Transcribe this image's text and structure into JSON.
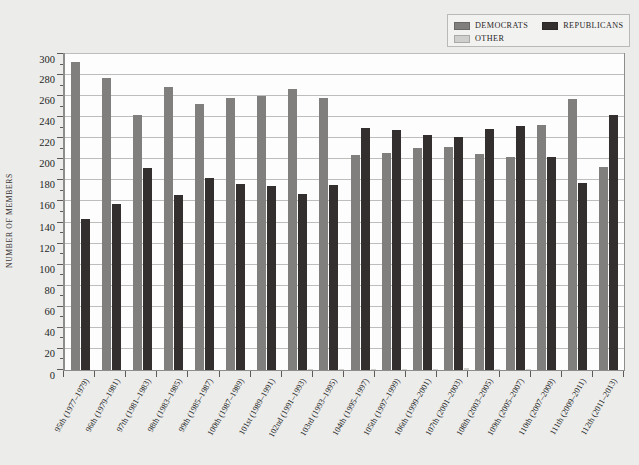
{
  "chart_data": {
    "type": "bar",
    "title": "",
    "subtitle": "",
    "xlabel": "",
    "ylabel": "NUMBER OF MEMBERS",
    "ylim": [
      0,
      300
    ],
    "ytick_step": 20,
    "yticks": [
      0,
      20,
      40,
      60,
      80,
      100,
      120,
      140,
      160,
      180,
      200,
      220,
      240,
      260,
      280,
      300
    ],
    "minor_tick_step": 10,
    "grid": true,
    "legend_position": "top-right",
    "categories": [
      "95th (1977–1979)",
      "96th (1979–1981)",
      "97th (1981–1983)",
      "98th (1983–1985)",
      "99th (1985–1987)",
      "100th (1987–1989)",
      "101st (1989–1991)",
      "102nd (1991–1993)",
      "103rd (1993–1995)",
      "104th (1995–1997)",
      "105th (1997–1999)",
      "106th (1999–2001)",
      "107th (2001–2003)",
      "108th (2003–2005)",
      "109th (2005–2007)",
      "110th (2007–2009)",
      "111th (2009–2011)",
      "112th (2011–2013)"
    ],
    "series": [
      {
        "name": "DEMOCRATS",
        "color": "#807f7d",
        "values": [
          292,
          277,
          242,
          269,
          253,
          258,
          260,
          267,
          258,
          204,
          206,
          211,
          212,
          205,
          202,
          233,
          257,
          193
        ]
      },
      {
        "name": "REPUBLICANS",
        "color": "#322f2e",
        "values": [
          143,
          158,
          192,
          166,
          182,
          177,
          175,
          167,
          176,
          230,
          228,
          223,
          221,
          229,
          232,
          202,
          178,
          242
        ]
      },
      {
        "name": "OTHER",
        "color": "#cfcfcd",
        "values": [
          0,
          0,
          0,
          0,
          0,
          0,
          0,
          1,
          1,
          1,
          1,
          1,
          2,
          1,
          1,
          0,
          0,
          0
        ]
      }
    ]
  },
  "legend": {
    "items": [
      {
        "label": "DEMOCRATS",
        "color": "#807f7d"
      },
      {
        "label": "REPUBLICANS",
        "color": "#322f2e"
      },
      {
        "label": "OTHER",
        "color": "#cfcfcd"
      }
    ]
  },
  "axis": {
    "y_title": "NUMBER OF MEMBERS"
  }
}
